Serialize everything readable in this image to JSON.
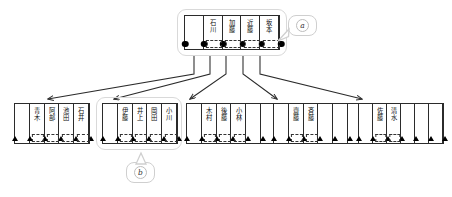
{
  "diagram": {
    "title_present": false,
    "colors": {
      "line": "#2b2b2b",
      "marker": "#000000",
      "group_outline": "#d9d9d9",
      "background": "#ffffff",
      "dash": "#333333"
    },
    "callouts": [
      {
        "id": "a",
        "label": "a",
        "points_to": "top-table",
        "tail": "left"
      },
      {
        "id": "b",
        "label": "b",
        "points_to": "bottom-group-2",
        "tail": "up"
      }
    ],
    "top_table": {
      "name": "root-node-table",
      "marker_type": "dot",
      "cell_count": 5,
      "cells": [
        {
          "index": 0,
          "text": "",
          "marker": "dot"
        },
        {
          "index": 1,
          "text": "石川",
          "marker": "dot"
        },
        {
          "index": 2,
          "text": "加藤",
          "marker": "dot"
        },
        {
          "index": 3,
          "text": "近藤",
          "marker": "dot"
        },
        {
          "index": 4,
          "text": "坂本",
          "marker": "dot"
        }
      ]
    },
    "leaf_groups": [
      {
        "index": 0,
        "name": "leaf-group-1",
        "highlighted": false,
        "marker_type": "triangle",
        "cells": [
          {
            "index": 0,
            "text": ""
          },
          {
            "index": 1,
            "text": "青木"
          },
          {
            "index": 2,
            "text": "阿部"
          },
          {
            "index": 3,
            "text": "池田"
          },
          {
            "index": 4,
            "text": "石井"
          }
        ]
      },
      {
        "index": 1,
        "name": "leaf-group-2",
        "highlighted": true,
        "marker_type": "triangle",
        "cells": [
          {
            "index": 0,
            "text": ""
          },
          {
            "index": 1,
            "text": "伊藤"
          },
          {
            "index": 2,
            "text": "井上"
          },
          {
            "index": 3,
            "text": "岡田"
          },
          {
            "index": 4,
            "text": "小川"
          }
        ]
      },
      {
        "index": 2,
        "name": "leaf-group-3",
        "highlighted": false,
        "marker_type": "triangle",
        "cells": [
          {
            "index": 0,
            "text": ""
          },
          {
            "index": 1,
            "text": "木村"
          },
          {
            "index": 2,
            "text": "後藤"
          },
          {
            "index": 3,
            "text": "小林"
          },
          {
            "index": 4,
            "text": ""
          },
          {
            "index": 5,
            "text": ""
          }
        ]
      },
      {
        "index": 3,
        "name": "leaf-group-4",
        "highlighted": false,
        "marker_type": "triangle",
        "cells": [
          {
            "index": 0,
            "text": ""
          },
          {
            "index": 1,
            "text": "齋藤"
          },
          {
            "index": 2,
            "text": "斉藤"
          },
          {
            "index": 3,
            "text": ""
          },
          {
            "index": 4,
            "text": ""
          },
          {
            "index": 5,
            "text": ""
          }
        ]
      },
      {
        "index": 4,
        "name": "leaf-group-5",
        "highlighted": false,
        "marker_type": "triangle",
        "cells": [
          {
            "index": 0,
            "text": ""
          },
          {
            "index": 1,
            "text": "佐藤"
          },
          {
            "index": 2,
            "text": "清水"
          },
          {
            "index": 3,
            "text": ""
          },
          {
            "index": 4,
            "text": ""
          },
          {
            "index": 5,
            "text": ""
          }
        ]
      }
    ],
    "arrows": [
      {
        "index": 0,
        "from": "top-table",
        "to": "leaf-group-1",
        "direction": "down-left"
      },
      {
        "index": 1,
        "from": "top-table",
        "to": "leaf-group-2",
        "direction": "down-left"
      },
      {
        "index": 2,
        "from": "top-table",
        "to": "leaf-group-3",
        "direction": "down"
      },
      {
        "index": 3,
        "from": "top-table",
        "to": "leaf-group-4",
        "direction": "down-right"
      },
      {
        "index": 4,
        "from": "top-table",
        "to": "leaf-group-5",
        "direction": "down-right"
      }
    ]
  }
}
